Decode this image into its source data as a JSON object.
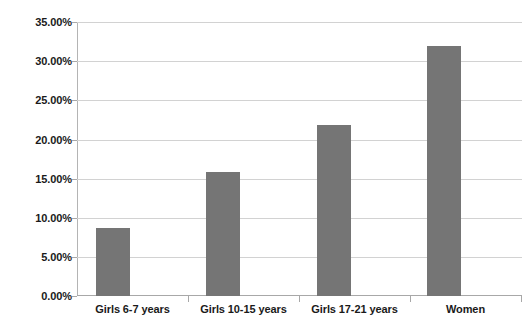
{
  "chart_data": {
    "type": "bar",
    "title": "",
    "subtitle": "",
    "xlabel": "",
    "ylabel": "",
    "categories": [
      "Girls 6-7 years",
      "Girls 10-15 years",
      "Girls 17-21 years",
      "Women"
    ],
    "values": [
      8.7,
      15.8,
      21.8,
      31.9
    ],
    "value_labels": [
      "8.70%",
      "15.80%",
      "21.80%",
      "31.90%"
    ],
    "series": [
      {
        "name": "",
        "values": [
          8.7,
          15.8,
          21.8,
          31.9
        ]
      }
    ],
    "ylim": [
      0,
      35
    ],
    "ytick_step": 5,
    "ytick_values": [
      0,
      5,
      10,
      15,
      20,
      25,
      30,
      35
    ],
    "ytick_labels": [
      "0.00%",
      "5.00%",
      "10.00%",
      "15.00%",
      "20.00%",
      "25.00%",
      "30.00%",
      "35.00%"
    ],
    "grid": true,
    "grid_axis": "y",
    "legend": false,
    "legend_position": "none",
    "bar_color": "#757575",
    "grid_color": "#d2d2d2",
    "axis_color": "#a8a8a8",
    "text_color": "#1a1a1a",
    "background_color": "#ffffff"
  }
}
